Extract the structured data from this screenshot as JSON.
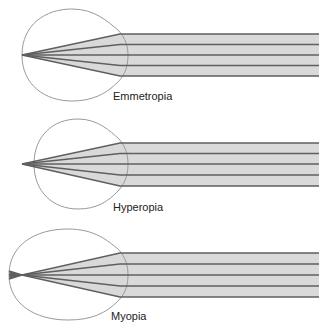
{
  "diagram": {
    "panels": [
      {
        "id": "emmetropia",
        "label": "Emmetropia",
        "focus": "on retina"
      },
      {
        "id": "hyperopia",
        "label": "Hyperopia",
        "focus": "behind retina"
      },
      {
        "id": "myopia",
        "label": "Myopia",
        "focus": "in front of retina"
      }
    ],
    "colors": {
      "beam_fill": "#d9d9d9",
      "ray": "#5f5f5f",
      "eye_outline": "#9a9a9a",
      "label": "#222222"
    }
  }
}
